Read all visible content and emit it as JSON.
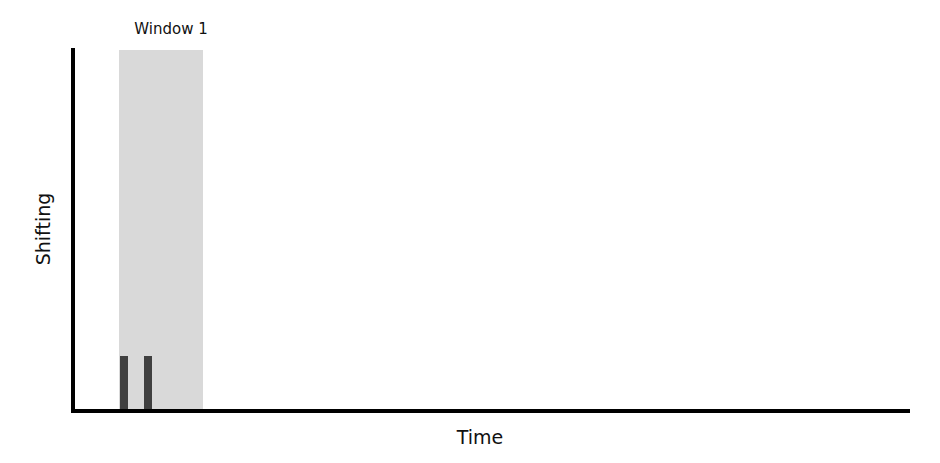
{
  "diagram": {
    "window_label": "Window 1",
    "x_axis_label": "Time",
    "y_axis_label": "Shifting",
    "colors": {
      "window_shade": "#d9d9d9",
      "bars": "#404040",
      "axes": "#000000"
    },
    "bars": [
      {
        "name": "shift-event-1",
        "relative_height": "low"
      },
      {
        "name": "shift-event-2",
        "relative_height": "low"
      }
    ]
  }
}
